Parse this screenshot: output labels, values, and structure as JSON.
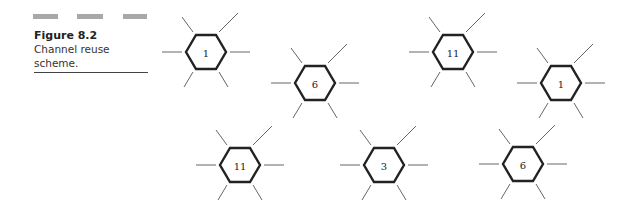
{
  "figure": {
    "number": "Figure 8.2",
    "caption": [
      "Channel reuse",
      "scheme."
    ]
  },
  "cells": [
    {
      "label": "1",
      "x": 206,
      "y": 52
    },
    {
      "label": "6",
      "x": 315,
      "y": 83
    },
    {
      "label": "11",
      "x": 453,
      "y": 52
    },
    {
      "label": "1",
      "x": 561,
      "y": 83
    },
    {
      "label": "11",
      "x": 240,
      "y": 165
    },
    {
      "label": "3",
      "x": 384,
      "y": 165
    },
    {
      "label": "6",
      "x": 523,
      "y": 164
    }
  ]
}
